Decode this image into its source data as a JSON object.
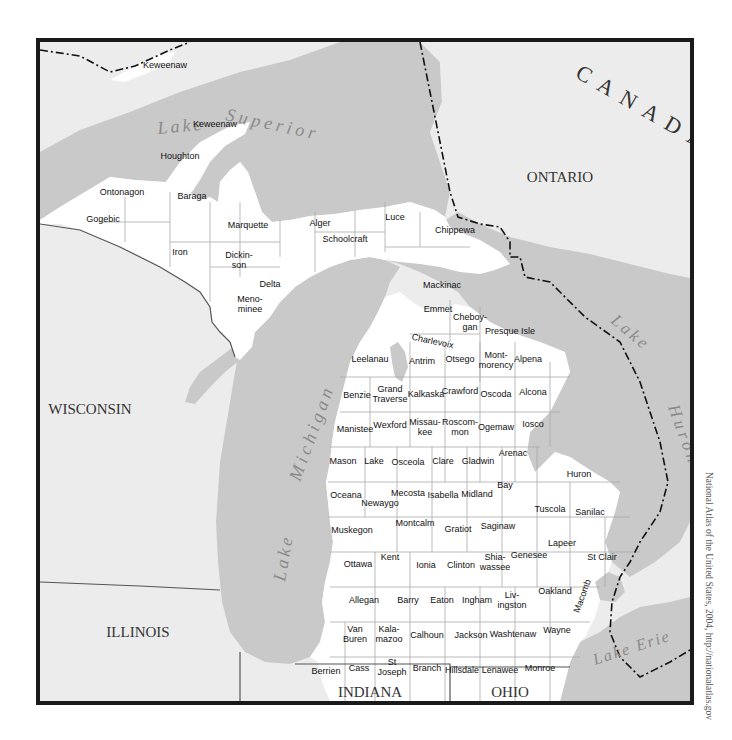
{
  "map": {
    "title": "Michigan counties",
    "colors": {
      "water": "#c9c9c9",
      "land_other": "#ececec",
      "michigan_land": "#ffffff",
      "frame": "#1a1a1a",
      "border_line": "#111111"
    },
    "regions": {
      "canada": "CANADA",
      "ontario": "ONTARIO",
      "wisconsin": "WISCONSIN",
      "illinois": "ILLINOIS",
      "indiana": "INDIANA",
      "ohio": "OHIO"
    },
    "water_bodies": {
      "lake_superior_1": "Lake",
      "lake_superior_2": "Superior",
      "lake_michigan_1": "Lake",
      "lake_michigan_2": "Michigan",
      "lake_huron_1": "Lake",
      "lake_huron_2": "Huron",
      "lake_erie": "Lake Erie"
    },
    "upper_peninsula_counties": [
      {
        "name": "Keweenaw"
      },
      {
        "name": "Keweenaw"
      },
      {
        "name": "Houghton"
      },
      {
        "name": "Ontonagon"
      },
      {
        "name": "Baraga"
      },
      {
        "name": "Gogebic"
      },
      {
        "name": "Iron"
      },
      {
        "name": "Marquette"
      },
      {
        "name": "Alger"
      },
      {
        "name": "Dickin-",
        "line2": "son"
      },
      {
        "name": "Delta"
      },
      {
        "name": "Schoolcraft"
      },
      {
        "name": "Luce"
      },
      {
        "name": "Chippewa"
      },
      {
        "name": "Mackinac"
      },
      {
        "name": "Meno-",
        "line2": "minee"
      }
    ],
    "lower_peninsula_counties": [
      {
        "name": "Emmet"
      },
      {
        "name": "Cheboy-",
        "line2": "gan"
      },
      {
        "name": "Presque Isle"
      },
      {
        "name": "Charlevoix"
      },
      {
        "name": "Leelanau"
      },
      {
        "name": "Antrim"
      },
      {
        "name": "Otsego"
      },
      {
        "name": "Mont-",
        "line2": "morency"
      },
      {
        "name": "Alpena"
      },
      {
        "name": "Benzie"
      },
      {
        "name": "Grand",
        "line2": "Traverse"
      },
      {
        "name": "Kalkaska"
      },
      {
        "name": "Crawford"
      },
      {
        "name": "Oscoda"
      },
      {
        "name": "Alcona"
      },
      {
        "name": "Manistee"
      },
      {
        "name": "Wexford"
      },
      {
        "name": "Missau-",
        "line2": "kee"
      },
      {
        "name": "Roscom-",
        "line2": "mon"
      },
      {
        "name": "Ogemaw"
      },
      {
        "name": "Iosco"
      },
      {
        "name": "Mason"
      },
      {
        "name": "Lake"
      },
      {
        "name": "Osceola"
      },
      {
        "name": "Clare"
      },
      {
        "name": "Gladwin"
      },
      {
        "name": "Arenac"
      },
      {
        "name": "Huron"
      },
      {
        "name": "Oceana"
      },
      {
        "name": "Newaygo"
      },
      {
        "name": "Mecosta"
      },
      {
        "name": "Isabella"
      },
      {
        "name": "Midland"
      },
      {
        "name": "Bay"
      },
      {
        "name": "Tuscola"
      },
      {
        "name": "Sanilac"
      },
      {
        "name": "Muskegon"
      },
      {
        "name": "Montcalm"
      },
      {
        "name": "Gratiot"
      },
      {
        "name": "Saginaw"
      },
      {
        "name": "Lapeer"
      },
      {
        "name": "Ottawa"
      },
      {
        "name": "Kent"
      },
      {
        "name": "Ionia"
      },
      {
        "name": "Clinton"
      },
      {
        "name": "Shia-",
        "line2": "wassee"
      },
      {
        "name": "Genesee"
      },
      {
        "name": "St Clair"
      },
      {
        "name": "Allegan"
      },
      {
        "name": "Barry"
      },
      {
        "name": "Eaton"
      },
      {
        "name": "Ingham"
      },
      {
        "name": "Liv-",
        "line2": "ingston"
      },
      {
        "name": "Oakland"
      },
      {
        "name": "Macomb"
      },
      {
        "name": "Van",
        "line2": "Buren"
      },
      {
        "name": "Kala-",
        "line2": "mazoo"
      },
      {
        "name": "Calhoun"
      },
      {
        "name": "Jackson"
      },
      {
        "name": "Washtenaw"
      },
      {
        "name": "Wayne"
      },
      {
        "name": "Berrien"
      },
      {
        "name": "Cass"
      },
      {
        "name": "St",
        "line2": "Joseph"
      },
      {
        "name": "Branch"
      },
      {
        "name": "Hillsdale"
      },
      {
        "name": "Lenawee"
      },
      {
        "name": "Monroe"
      }
    ],
    "credit": "National Atlas of the United States, 2004, http://nationalatlas.gov"
  }
}
